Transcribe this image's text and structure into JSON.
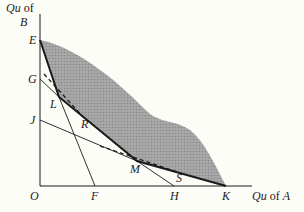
{
  "axes": {
    "y_label_line1": "Qu",
    "y_label_line1_suffix": " of",
    "y_label_line2": "B",
    "x_label_qu": "Qu",
    "x_label_of": " of ",
    "x_label_a": "A"
  },
  "points": {
    "E": "E",
    "G": "G",
    "J": "J",
    "L": "L",
    "R": "R",
    "M": "M",
    "S": "S",
    "O": "O",
    "F": "F",
    "H": "H",
    "K": "K"
  },
  "colors": {
    "shade": "#9a9a9a",
    "line": "#1a1a1a",
    "background": "#fdfdf8"
  }
}
